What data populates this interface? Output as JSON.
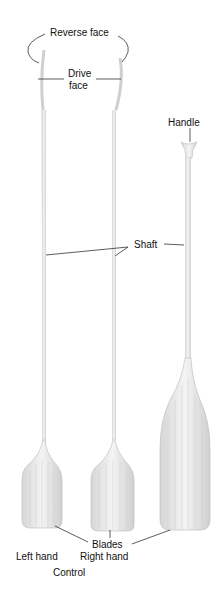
{
  "diagram": {
    "labels": {
      "reverse_face": "Reverse face",
      "drive_face_1": "Drive",
      "drive_face_2": "face",
      "handle": "Handle",
      "shaft": "Shaft",
      "blades": "Blades",
      "left_hand": "Left hand",
      "right_hand": "Right hand",
      "control": "Control"
    },
    "paddles": [
      {
        "name": "left-hand-control-paddle"
      },
      {
        "name": "right-hand-control-paddle"
      },
      {
        "name": "canoe-paddle"
      }
    ],
    "colors": {
      "line": "#333333",
      "wood": "#e6e6e6",
      "grain": "#bdbdbd"
    }
  }
}
